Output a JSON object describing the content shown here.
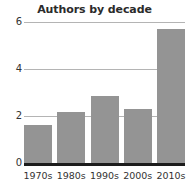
{
  "chart_data": {
    "type": "bar",
    "title": "Authors by decade",
    "xlabel": "",
    "ylabel": "",
    "categories": [
      "1970s",
      "1980s",
      "1990s",
      "2000s",
      "2010s"
    ],
    "values": [
      1.6,
      2.15,
      2.85,
      2.3,
      5.7
    ],
    "ylim": [
      0,
      6
    ],
    "yticks": [
      0,
      2,
      4,
      6
    ],
    "ytick_labels": [
      "0",
      "2",
      "4",
      "6"
    ],
    "grid": true,
    "legend": false,
    "colors": {
      "bar": "#949494",
      "gridline": "#b4b4b4",
      "axis": "#1c1c1c",
      "title_text": "#2b2b2b",
      "tick_text": "#333333",
      "background": "#ffffff"
    }
  }
}
